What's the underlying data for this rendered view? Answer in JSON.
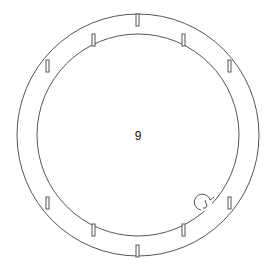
{
  "diagram": {
    "type": "part-outline",
    "label": "9",
    "stroke_color": "#555555",
    "background": "#ffffff",
    "center": [
      138,
      135
    ],
    "outer_radius": 121,
    "inner_radius": 101,
    "outer_notches_deg": [
      -90,
      -150,
      -30,
      150,
      30,
      90
    ],
    "inner_notches_deg": [
      -117,
      -63,
      117,
      63
    ],
    "hook_feature": {
      "position": [
        200,
        203
      ],
      "radius": 8
    }
  }
}
